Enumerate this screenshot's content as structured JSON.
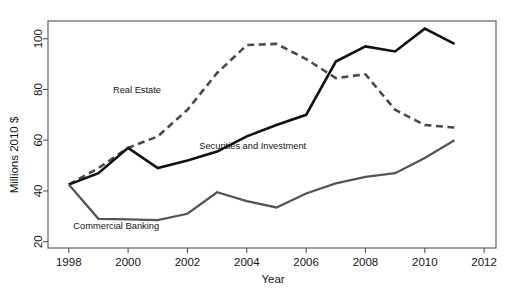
{
  "chart_data": {
    "type": "line",
    "title": "",
    "xlabel": "Year",
    "ylabel": "Millions 2010 $",
    "xlim": [
      1997.3,
      2012.4
    ],
    "ylim": [
      17.5,
      107
    ],
    "grid": false,
    "legend_position": "inline-labels",
    "x_ticks": [
      1998,
      2000,
      2002,
      2004,
      2006,
      2008,
      2010,
      2012
    ],
    "x_tick_labels": [
      "1998",
      "2000",
      "2002",
      "2004",
      "2006",
      "2008",
      "2010",
      "2012"
    ],
    "y_ticks": [
      20,
      40,
      60,
      80,
      100
    ],
    "y_tick_labels": [
      "20",
      "40",
      "60",
      "80",
      "100"
    ],
    "x": [
      1998,
      1999,
      2000,
      2001,
      2002,
      2003,
      2004,
      2005,
      2006,
      2007,
      2008,
      2009,
      2010,
      2011
    ],
    "series": [
      {
        "name": "Real Estate",
        "style": "dashed",
        "color": "#4a4a4a",
        "label_x": 2000.3,
        "label_y": 78.5,
        "values": [
          42.5,
          49.0,
          57.0,
          61.5,
          72.0,
          86.5,
          97.5,
          98.0,
          92.0,
          84.5,
          86.0,
          72.0,
          66.0,
          65.0
        ]
      },
      {
        "name": "Securities and Investment",
        "style": "solid",
        "color": "#111111",
        "label_x": 2004.2,
        "label_y": 56.5,
        "values": [
          42.5,
          47.0,
          57.0,
          49.0,
          52.0,
          55.5,
          61.5,
          66.0,
          70.0,
          91.0,
          97.0,
          95.0,
          104.0,
          98.0
        ]
      },
      {
        "name": "Commercial Banking",
        "style": "solid",
        "color": "#555555",
        "label_x": 1999.6,
        "label_y": 25.0,
        "values": [
          42.5,
          29.0,
          28.8,
          28.5,
          31.0,
          39.5,
          36.0,
          33.5,
          39.0,
          43.0,
          45.5,
          47.0,
          53.0,
          60.0
        ]
      }
    ]
  }
}
